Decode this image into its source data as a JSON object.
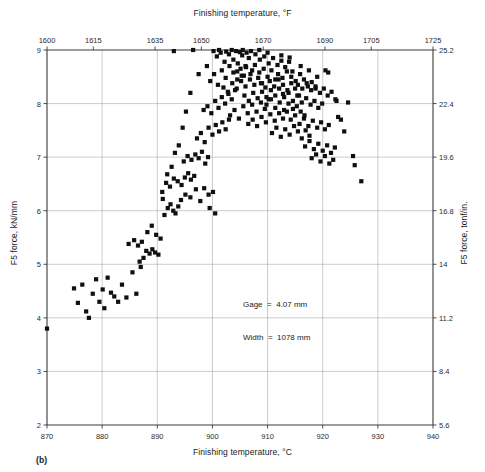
{
  "figure": {
    "caption": "(b)",
    "note_line1": "Gage  =  4.07 mm",
    "note_line2": "Width  =  1078 mm"
  },
  "chart_data": {
    "type": "scatter",
    "title": "",
    "xlabel": "Finishing temperature, °C",
    "ylabel": "F5 force, kN/mm",
    "x2label": "Finishing temperature, °F",
    "y2label": "F5 force, tonf/in.",
    "xlim": [
      870,
      940
    ],
    "ylim": [
      2,
      9
    ],
    "x2lim": [
      1600,
      1725
    ],
    "y2lim": [
      5.6,
      25.2
    ],
    "xticks": [
      870,
      880,
      890,
      900,
      910,
      920,
      930,
      940
    ],
    "yticks": [
      2,
      3,
      4,
      5,
      6,
      7,
      8,
      9
    ],
    "x2ticks": [
      1600,
      1615,
      1635,
      1650,
      1670,
      1690,
      1705,
      1725
    ],
    "y2ticks": [
      5.6,
      8.4,
      11.2,
      14,
      16.8,
      19.6,
      22.4,
      25.2
    ],
    "grid": true,
    "legend": "none",
    "marker": "square",
    "marker_color": "#101010",
    "annotations": [
      "Gage  =  4.07 mm",
      "Width  =  1078 mm"
    ],
    "points": [
      [
        870.0,
        3.8
      ],
      [
        874.9,
        4.55
      ],
      [
        875.6,
        4.28
      ],
      [
        876.4,
        4.62
      ],
      [
        877.1,
        4.12
      ],
      [
        877.6,
        4.0
      ],
      [
        878.3,
        4.45
      ],
      [
        878.9,
        4.72
      ],
      [
        879.5,
        4.3
      ],
      [
        880.1,
        4.53
      ],
      [
        880.4,
        4.18
      ],
      [
        881.0,
        4.75
      ],
      [
        881.6,
        4.47
      ],
      [
        882.2,
        4.4
      ],
      [
        882.9,
        4.3
      ],
      [
        883.6,
        4.62
      ],
      [
        884.4,
        4.38
      ],
      [
        886.2,
        4.45
      ],
      [
        887.5,
        5.12
      ],
      [
        888.0,
        5.25
      ],
      [
        888.6,
        5.2
      ],
      [
        889.1,
        5.28
      ],
      [
        889.6,
        5.22
      ],
      [
        890.2,
        5.18
      ],
      [
        888.2,
        5.6
      ],
      [
        889.0,
        5.72
      ],
      [
        889.8,
        5.55
      ],
      [
        890.6,
        5.48
      ],
      [
        891.3,
        5.92
      ],
      [
        891.9,
        6.05
      ],
      [
        892.4,
        6.12
      ],
      [
        892.9,
        6.0
      ],
      [
        893.3,
        5.95
      ],
      [
        893.8,
        6.08
      ],
      [
        894.3,
        6.2
      ],
      [
        890.9,
        6.35
      ],
      [
        891.6,
        6.52
      ],
      [
        892.3,
        6.45
      ],
      [
        893.0,
        6.6
      ],
      [
        893.7,
        6.55
      ],
      [
        894.4,
        6.48
      ],
      [
        895.0,
        6.62
      ],
      [
        895.6,
        6.7
      ],
      [
        896.1,
        6.58
      ],
      [
        896.7,
        6.65
      ],
      [
        894.8,
        6.92
      ],
      [
        895.5,
        7.02
      ],
      [
        896.2,
        6.95
      ],
      [
        896.9,
        7.05
      ],
      [
        897.5,
        6.98
      ],
      [
        898.1,
        7.1
      ],
      [
        898.7,
        6.88
      ],
      [
        899.2,
        7.0
      ],
      [
        895.1,
        6.3
      ],
      [
        896.0,
        6.25
      ],
      [
        897.0,
        6.4
      ],
      [
        897.8,
        6.18
      ],
      [
        898.5,
        6.42
      ],
      [
        899.3,
        6.3
      ],
      [
        900.1,
        6.35
      ],
      [
        897.2,
        7.35
      ],
      [
        897.9,
        7.45
      ],
      [
        898.6,
        7.28
      ],
      [
        899.3,
        7.55
      ],
      [
        900.0,
        7.42
      ],
      [
        900.6,
        7.6
      ],
      [
        901.2,
        7.48
      ],
      [
        901.8,
        7.65
      ],
      [
        902.4,
        7.52
      ],
      [
        903.0,
        7.7
      ],
      [
        898.4,
        7.88
      ],
      [
        899.1,
        7.95
      ],
      [
        899.8,
        7.82
      ],
      [
        900.5,
        8.05
      ],
      [
        901.1,
        7.92
      ],
      [
        901.7,
        8.12
      ],
      [
        902.3,
        8.0
      ],
      [
        902.9,
        8.18
      ],
      [
        903.5,
        8.08
      ],
      [
        904.1,
        8.25
      ],
      [
        899.6,
        8.42
      ],
      [
        900.3,
        8.55
      ],
      [
        901.0,
        8.35
      ],
      [
        901.7,
        8.62
      ],
      [
        902.4,
        8.48
      ],
      [
        903.1,
        8.7
      ],
      [
        903.8,
        8.58
      ],
      [
        904.5,
        8.45
      ],
      [
        905.1,
        8.65
      ],
      [
        905.7,
        8.52
      ],
      [
        900.8,
        8.88
      ],
      [
        901.5,
        8.95
      ],
      [
        902.2,
        8.78
      ],
      [
        903.0,
        8.92
      ],
      [
        903.8,
        8.82
      ],
      [
        904.6,
        8.75
      ],
      [
        905.4,
        8.9
      ],
      [
        906.0,
        8.7
      ],
      [
        906.6,
        8.85
      ],
      [
        907.2,
        8.62
      ],
      [
        902.0,
        8.3
      ],
      [
        902.8,
        8.22
      ],
      [
        903.6,
        8.38
      ],
      [
        904.4,
        8.28
      ],
      [
        905.2,
        8.42
      ],
      [
        906.0,
        8.32
      ],
      [
        906.8,
        8.45
      ],
      [
        907.6,
        8.35
      ],
      [
        908.3,
        8.48
      ],
      [
        909.0,
        8.38
      ],
      [
        903.2,
        7.78
      ],
      [
        904.0,
        7.88
      ],
      [
        904.8,
        7.72
      ],
      [
        905.6,
        7.95
      ],
      [
        906.4,
        7.82
      ],
      [
        907.2,
        7.98
      ],
      [
        908.0,
        7.85
      ],
      [
        908.8,
        8.02
      ],
      [
        909.5,
        7.9
      ],
      [
        910.2,
        8.08
      ],
      [
        904.5,
        8.6
      ],
      [
        905.3,
        8.52
      ],
      [
        906.1,
        8.68
      ],
      [
        906.9,
        8.55
      ],
      [
        907.7,
        8.72
      ],
      [
        908.5,
        8.58
      ],
      [
        909.3,
        8.65
      ],
      [
        910.0,
        8.5
      ],
      [
        910.7,
        8.62
      ],
      [
        911.4,
        8.45
      ],
      [
        905.8,
        8.15
      ],
      [
        906.6,
        8.05
      ],
      [
        907.4,
        8.2
      ],
      [
        908.2,
        8.1
      ],
      [
        909.0,
        8.22
      ],
      [
        909.8,
        8.12
      ],
      [
        910.6,
        8.25
      ],
      [
        911.4,
        8.15
      ],
      [
        912.1,
        8.28
      ],
      [
        912.8,
        8.18
      ],
      [
        906.5,
        7.62
      ],
      [
        907.3,
        7.7
      ],
      [
        908.1,
        7.58
      ],
      [
        908.9,
        7.75
      ],
      [
        909.7,
        7.65
      ],
      [
        910.5,
        7.8
      ],
      [
        911.3,
        7.68
      ],
      [
        912.1,
        7.82
      ],
      [
        912.8,
        7.72
      ],
      [
        913.5,
        7.85
      ],
      [
        907.8,
        8.92
      ],
      [
        908.6,
        8.82
      ],
      [
        909.4,
        8.88
      ],
      [
        910.2,
        8.75
      ],
      [
        911.0,
        8.85
      ],
      [
        911.8,
        8.72
      ],
      [
        912.5,
        8.8
      ],
      [
        913.2,
        8.68
      ],
      [
        913.9,
        8.78
      ],
      [
        914.5,
        8.6
      ],
      [
        908.8,
        8.38
      ],
      [
        909.6,
        8.3
      ],
      [
        910.4,
        8.42
      ],
      [
        911.2,
        8.32
      ],
      [
        912.0,
        8.45
      ],
      [
        912.8,
        8.35
      ],
      [
        913.6,
        8.25
      ],
      [
        914.3,
        8.38
      ],
      [
        915.0,
        8.28
      ],
      [
        915.7,
        8.15
      ],
      [
        909.8,
        7.98
      ],
      [
        910.6,
        8.08
      ],
      [
        911.4,
        7.92
      ],
      [
        912.2,
        8.02
      ],
      [
        913.0,
        7.88
      ],
      [
        913.8,
        8.0
      ],
      [
        914.6,
        7.9
      ],
      [
        915.3,
        7.95
      ],
      [
        916.0,
        7.85
      ],
      [
        916.7,
        7.78
      ],
      [
        910.8,
        7.45
      ],
      [
        911.6,
        7.55
      ],
      [
        912.4,
        7.38
      ],
      [
        913.2,
        7.52
      ],
      [
        914.0,
        7.42
      ],
      [
        914.8,
        7.58
      ],
      [
        915.5,
        7.48
      ],
      [
        916.2,
        7.35
      ],
      [
        916.9,
        7.5
      ],
      [
        917.6,
        7.4
      ],
      [
        911.9,
        8.55
      ],
      [
        912.7,
        8.48
      ],
      [
        913.5,
        8.6
      ],
      [
        914.3,
        8.5
      ],
      [
        915.1,
        8.42
      ],
      [
        915.9,
        8.55
      ],
      [
        916.6,
        8.45
      ],
      [
        917.3,
        8.32
      ],
      [
        918.0,
        8.4
      ],
      [
        918.7,
        8.28
      ],
      [
        913.0,
        8.12
      ],
      [
        913.8,
        8.2
      ],
      [
        914.6,
        8.05
      ],
      [
        915.4,
        8.15
      ],
      [
        916.2,
        8.02
      ],
      [
        917.0,
        8.1
      ],
      [
        917.8,
        7.98
      ],
      [
        918.5,
        8.05
      ],
      [
        919.2,
        7.92
      ],
      [
        919.9,
        8.0
      ],
      [
        914.2,
        7.7
      ],
      [
        915.0,
        7.78
      ],
      [
        915.8,
        7.62
      ],
      [
        916.6,
        7.72
      ],
      [
        917.4,
        7.58
      ],
      [
        918.2,
        7.68
      ],
      [
        919.0,
        7.55
      ],
      [
        919.7,
        7.65
      ],
      [
        920.4,
        7.52
      ],
      [
        921.1,
        7.6
      ],
      [
        915.5,
        8.35
      ],
      [
        916.3,
        8.28
      ],
      [
        917.1,
        8.38
      ],
      [
        917.9,
        8.25
      ],
      [
        918.7,
        8.32
      ],
      [
        919.5,
        8.2
      ],
      [
        920.2,
        8.28
      ],
      [
        920.9,
        8.15
      ],
      [
        921.6,
        8.22
      ],
      [
        922.3,
        8.08
      ],
      [
        916.8,
        7.2
      ],
      [
        917.6,
        7.3
      ],
      [
        918.4,
        7.15
      ],
      [
        919.2,
        7.25
      ],
      [
        920.0,
        7.12
      ],
      [
        920.8,
        7.22
      ],
      [
        921.5,
        7.08
      ],
      [
        922.2,
        7.18
      ],
      [
        918.0,
        6.98
      ],
      [
        918.8,
        7.05
      ],
      [
        919.6,
        6.92
      ],
      [
        920.4,
        7.02
      ],
      [
        921.2,
        6.88
      ],
      [
        921.9,
        6.95
      ],
      [
        903.5,
        9.0
      ],
      [
        904.3,
        8.98
      ],
      [
        905.0,
        8.96
      ],
      [
        906.2,
        8.95
      ],
      [
        900.2,
        8.98
      ],
      [
        896.5,
        9.0
      ],
      [
        893.0,
        8.98
      ],
      [
        901.2,
        9.0
      ],
      [
        902.5,
        8.97
      ],
      [
        922.5,
        8.05
      ],
      [
        922.8,
        7.75
      ],
      [
        923.3,
        7.7
      ],
      [
        923.9,
        7.48
      ],
      [
        924.6,
        8.02
      ],
      [
        925.5,
        7.02
      ],
      [
        925.8,
        6.85
      ],
      [
        927.0,
        6.55
      ],
      [
        920.5,
        8.62
      ],
      [
        921.0,
        8.58
      ],
      [
        899.0,
        8.7
      ],
      [
        897.5,
        8.55
      ],
      [
        896.0,
        8.2
      ],
      [
        895.2,
        7.85
      ],
      [
        894.6,
        7.55
      ],
      [
        893.9,
        7.22
      ],
      [
        893.2,
        7.08
      ],
      [
        892.6,
        6.82
      ],
      [
        891.8,
        6.68
      ],
      [
        891.0,
        6.22
      ],
      [
        899.5,
        6.05
      ],
      [
        900.5,
        5.95
      ],
      [
        887.0,
        4.95
      ],
      [
        885.5,
        4.85
      ],
      [
        886.8,
        5.05
      ],
      [
        884.8,
        5.38
      ],
      [
        885.8,
        5.45
      ],
      [
        886.5,
        5.35
      ],
      [
        887.2,
        5.42
      ],
      [
        905.5,
        9.0
      ],
      [
        907.0,
        8.98
      ],
      [
        908.5,
        9.0
      ],
      [
        910.0,
        8.95
      ],
      [
        912.5,
        8.9
      ],
      [
        914.0,
        8.86
      ],
      [
        916.0,
        8.7
      ],
      [
        917.5,
        8.62
      ],
      [
        919.0,
        8.5
      ]
    ]
  }
}
